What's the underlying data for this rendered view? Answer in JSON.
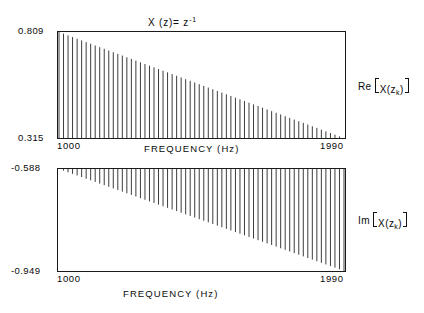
{
  "figure": {
    "title": "X (z)= z",
    "title_exponent": "-1",
    "background": "#ffffff",
    "ink": "#1a1a1a"
  },
  "panels": [
    {
      "id": "real-part",
      "side_label_prefix": "Re",
      "side_label_body": "X(z",
      "side_label_sub": "k",
      "side_label_suffix": ")",
      "ytick_top": "0.809",
      "ytick_bottom": "0.315",
      "xtick_left": "1000",
      "xtick_right": "1990",
      "xaxis_title": "FREQUENCY  (Hz)"
    },
    {
      "id": "imag-part",
      "side_label_prefix": "Im",
      "side_label_body": "X(z",
      "side_label_sub": "k",
      "side_label_suffix": ")",
      "ytick_top": "-0.588",
      "ytick_bottom": "-0.949",
      "xtick_left": "1000",
      "xtick_right": "1990",
      "xaxis_title": "FREQUENCY  (Hz)"
    }
  ],
  "chart_data": [
    {
      "type": "bar",
      "id": "real-part",
      "title": "X (z) = z^-1",
      "xlabel": "FREQUENCY  (Hz)",
      "ylabel": "Re [X(z_k)]",
      "xlim": [
        1000,
        1990
      ],
      "ylim": [
        0.315,
        0.809
      ],
      "xtick_labels": [
        "1000",
        "1990"
      ],
      "ytick_labels": [
        "0.315",
        "0.809"
      ],
      "grid": false,
      "legend": "none",
      "baseline": 0.315,
      "n_points": 64,
      "note": "Vertical stems drawn from the lower axis (0.315) up to the data value; envelope decays linearly from 0.809 at 1000 Hz to 0.315 at 1990 Hz.",
      "x": [
        1000,
        1015.7,
        1031.4,
        1047.1,
        1062.9,
        1078.6,
        1094.3,
        1110,
        1125.7,
        1141.4,
        1157.1,
        1172.9,
        1188.6,
        1204.3,
        1220,
        1235.7,
        1251.4,
        1267.1,
        1282.9,
        1298.6,
        1314.3,
        1330,
        1345.7,
        1361.4,
        1377.1,
        1392.9,
        1408.6,
        1424.3,
        1440,
        1455.7,
        1471.4,
        1487.1,
        1502.9,
        1518.6,
        1534.3,
        1550,
        1565.7,
        1581.4,
        1597.1,
        1612.9,
        1628.6,
        1644.3,
        1660,
        1675.7,
        1691.4,
        1707.1,
        1722.9,
        1738.6,
        1754.3,
        1770,
        1785.7,
        1801.4,
        1817.1,
        1832.9,
        1848.6,
        1864.3,
        1880,
        1895.7,
        1911.4,
        1927.1,
        1942.9,
        1958.6,
        1974.3,
        1990
      ],
      "values": [
        0.809,
        0.8012,
        0.7933,
        0.7855,
        0.7776,
        0.7698,
        0.7619,
        0.7541,
        0.7462,
        0.7384,
        0.7306,
        0.7227,
        0.7149,
        0.707,
        0.6992,
        0.6913,
        0.6835,
        0.6756,
        0.6678,
        0.6599,
        0.6521,
        0.6443,
        0.6364,
        0.6286,
        0.6207,
        0.6129,
        0.605,
        0.5972,
        0.5893,
        0.5815,
        0.5736,
        0.5658,
        0.558,
        0.5501,
        0.5423,
        0.5344,
        0.5266,
        0.5187,
        0.5109,
        0.503,
        0.4952,
        0.4873,
        0.4795,
        0.4717,
        0.4638,
        0.456,
        0.4481,
        0.4403,
        0.4324,
        0.4246,
        0.4167,
        0.4089,
        0.401,
        0.3932,
        0.3854,
        0.3775,
        0.3697,
        0.3618,
        0.354,
        0.3461,
        0.3383,
        0.3304,
        0.3226,
        0.315
      ]
    },
    {
      "type": "bar",
      "id": "imag-part",
      "title": "",
      "xlabel": "FREQUENCY  (Hz)",
      "ylabel": "Im [X(z_k)]",
      "xlim": [
        1000,
        1990
      ],
      "ylim": [
        -0.949,
        -0.588
      ],
      "xtick_labels": [
        "1000",
        "1990"
      ],
      "ytick_labels": [
        "-0.949",
        "-0.588"
      ],
      "grid": false,
      "legend": "none",
      "baseline": -0.588,
      "n_points": 64,
      "note": "Vertical stems drawn downward from the upper axis (-0.588) to the data value; envelope decays linearly from -0.588 at 1000 Hz to -0.949 at 1990 Hz.",
      "x": [
        1000,
        1015.7,
        1031.4,
        1047.1,
        1062.9,
        1078.6,
        1094.3,
        1110,
        1125.7,
        1141.4,
        1157.1,
        1172.9,
        1188.6,
        1204.3,
        1220,
        1235.7,
        1251.4,
        1267.1,
        1282.9,
        1298.6,
        1314.3,
        1330,
        1345.7,
        1361.4,
        1377.1,
        1392.9,
        1408.6,
        1424.3,
        1440,
        1455.7,
        1471.4,
        1487.1,
        1502.9,
        1518.6,
        1534.3,
        1550,
        1565.7,
        1581.4,
        1597.1,
        1612.9,
        1628.6,
        1644.3,
        1660,
        1675.7,
        1691.4,
        1707.1,
        1722.9,
        1738.6,
        1754.3,
        1770,
        1785.7,
        1801.4,
        1817.1,
        1832.9,
        1848.6,
        1864.3,
        1880,
        1895.7,
        1911.4,
        1927.1,
        1942.9,
        1958.6,
        1974.3,
        1990
      ],
      "values": [
        -0.588,
        -0.5937,
        -0.5995,
        -0.6052,
        -0.6109,
        -0.6166,
        -0.6224,
        -0.6281,
        -0.6338,
        -0.6395,
        -0.6453,
        -0.651,
        -0.6567,
        -0.6624,
        -0.6682,
        -0.6739,
        -0.6796,
        -0.6853,
        -0.6911,
        -0.6968,
        -0.7025,
        -0.7082,
        -0.714,
        -0.7197,
        -0.7254,
        -0.7311,
        -0.7369,
        -0.7426,
        -0.7483,
        -0.754,
        -0.7598,
        -0.7655,
        -0.7712,
        -0.7769,
        -0.7827,
        -0.7884,
        -0.7941,
        -0.7998,
        -0.8056,
        -0.8113,
        -0.817,
        -0.8227,
        -0.8285,
        -0.8342,
        -0.8399,
        -0.8456,
        -0.8514,
        -0.8571,
        -0.8628,
        -0.8685,
        -0.8743,
        -0.88,
        -0.8857,
        -0.8914,
        -0.8972,
        -0.9029,
        -0.9086,
        -0.9143,
        -0.9201,
        -0.9258,
        -0.9315,
        -0.9372,
        -0.943,
        -0.949
      ]
    }
  ]
}
